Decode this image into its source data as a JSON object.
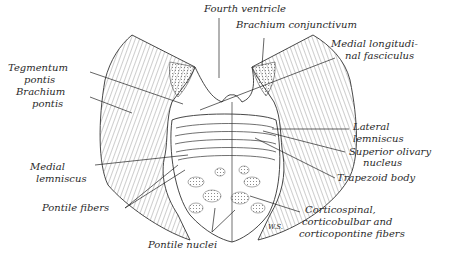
{
  "figure": {
    "signature": "W.S.",
    "labels": {
      "fourth_ventricle": "Fourth ventricle",
      "brachium_conjunctivum": "Brachium conjunctivum",
      "medial_longitudinal_fasciculus_1": "Medial longitudi-",
      "medial_longitudinal_fasciculus_2": "nal fasciculus",
      "tegmentum_pontis_1": "Tegmentum",
      "tegmentum_pontis_2": "pontis",
      "brachium_pontis_1": "Brachium",
      "brachium_pontis_2": "pontis",
      "lateral_lemniscus_1": "Lateral",
      "lateral_lemniscus_2": "lemniscus",
      "superior_olivary_nucleus_1": "Superior olivary",
      "superior_olivary_nucleus_2": "nucleus",
      "trapezoid_body": "Trapezoid body",
      "medial_lemniscus_1": "Medial",
      "medial_lemniscus_2": "lemniscus",
      "pontile_fibers": "Pontile fibers",
      "pontile_nuclei": "Pontile nuclei",
      "corticospinal_1": "Corticospinal,",
      "corticospinal_2": "corticobulbar and",
      "corticospinal_3": "corticopontine fibers"
    }
  }
}
